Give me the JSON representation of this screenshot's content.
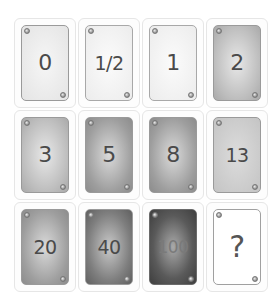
{
  "deck": {
    "description": "Planning poker card deck",
    "cards": [
      {
        "value": "0",
        "tone": "light"
      },
      {
        "value": "1/2",
        "tone": "lighter"
      },
      {
        "value": "1",
        "tone": "lighter"
      },
      {
        "value": "2",
        "tone": "mid"
      },
      {
        "value": "3",
        "tone": "mid"
      },
      {
        "value": "5",
        "tone": "dark"
      },
      {
        "value": "8",
        "tone": "dark"
      },
      {
        "value": "13",
        "tone": "midflat"
      },
      {
        "value": "20",
        "tone": "dark"
      },
      {
        "value": "40",
        "tone": "darker"
      },
      {
        "value": "100",
        "tone": "darkest"
      },
      {
        "value": "?",
        "tone": "white"
      }
    ]
  },
  "colors": {
    "card_border": "#9a9a9a",
    "value_text": "#4a4a4a",
    "cell_border": "#e6e6e6",
    "background": "#ffffff"
  }
}
